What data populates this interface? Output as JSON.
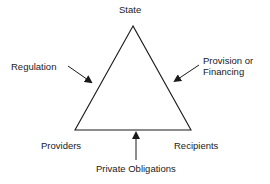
{
  "diagram": {
    "type": "triangle-relationship",
    "nodes": {
      "top": "State",
      "bottom_left": "Providers",
      "bottom_right": "Recipients"
    },
    "edges": {
      "left": {
        "label": "Regulation",
        "arrow_direction": "toward left edge (State-Providers)"
      },
      "right": {
        "label_line1": "Provision or",
        "label_line2": "Financing",
        "arrow_direction": "toward right edge (State-Recipients)"
      },
      "bottom": {
        "label": "Private Obligations",
        "arrow_direction": "up toward bottom edge (Providers-Recipients)"
      }
    },
    "colors": {
      "stroke": "#1a1a1a",
      "background": "#ffffff",
      "text": "#1a1a1a"
    }
  }
}
